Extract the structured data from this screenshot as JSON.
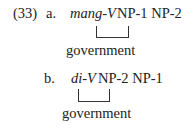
{
  "example": {
    "number": "(33)",
    "items": [
      {
        "label": "a.",
        "verb": "mang-V",
        "args": "NP-1 NP-2",
        "bracket_link": [
          "V",
          "NP-1"
        ],
        "annotation": "government"
      },
      {
        "label": "b.",
        "verb": "di-V",
        "args": "NP-2 NP-1",
        "bracket_link": [
          "V",
          "NP-2"
        ],
        "annotation": "government"
      }
    ]
  }
}
